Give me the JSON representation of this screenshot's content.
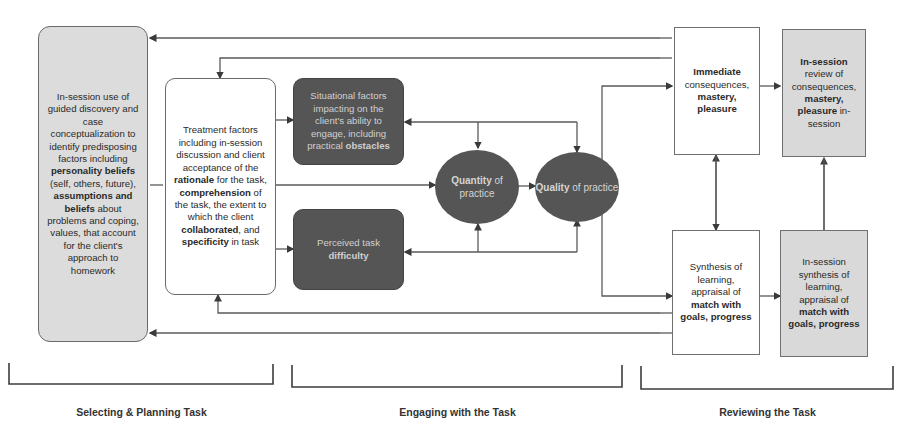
{
  "diagram": {
    "nodes": {
      "predisposing": {
        "parts": [
          {
            "t": "In-session use of guided discovery and case conceptualization to identify predisposing factors including ",
            "b": false
          },
          {
            "t": "personality beliefs",
            "b": true
          },
          {
            "t": " (self, others, future), ",
            "b": false
          },
          {
            "t": "assumptions and beliefs",
            "b": true
          },
          {
            "t": " about problems and coping, values, that account for the client's approach to homework",
            "b": false
          }
        ]
      },
      "treatment": {
        "parts": [
          {
            "t": "Treatment factors including in-session discussion and client acceptance of the ",
            "b": false
          },
          {
            "t": "rationale",
            "b": true
          },
          {
            "t": " for the task, ",
            "b": false
          },
          {
            "t": "comprehension",
            "b": true
          },
          {
            "t": " of the task, the extent to which the client ",
            "b": false
          },
          {
            "t": "collaborated",
            "b": true
          },
          {
            "t": ", and ",
            "b": false
          },
          {
            "t": "specificity",
            "b": true
          },
          {
            "t": " in task",
            "b": false
          }
        ]
      },
      "situational": {
        "parts": [
          {
            "t": "Situational factors impacting on the client's ability to engage, including practical ",
            "b": false
          },
          {
            "t": "obstacles",
            "b": true
          }
        ]
      },
      "difficulty": {
        "parts": [
          {
            "t": "Perceived task ",
            "b": false
          },
          {
            "t": "difficulty",
            "b": true
          }
        ]
      },
      "quantity": {
        "parts": [
          {
            "t": "Quantity",
            "b": true
          },
          {
            "t": " of practice",
            "b": false
          }
        ]
      },
      "quality": {
        "parts": [
          {
            "t": "Quality",
            "b": true
          },
          {
            "t": " of practice",
            "b": false
          }
        ]
      },
      "immediate": {
        "parts": [
          {
            "t": "Immediate",
            "b": true
          },
          {
            "t": " consequences, ",
            "b": false
          },
          {
            "t": "mastery, pleasure",
            "b": true
          }
        ]
      },
      "review": {
        "parts": [
          {
            "t": "In-session",
            "b": true
          },
          {
            "t": " review of consequences, ",
            "b": false
          },
          {
            "t": "mastery, pleasure",
            "b": true
          },
          {
            "t": " in-session",
            "b": false
          }
        ]
      },
      "synthesis": {
        "parts": [
          {
            "t": "Synthesis of learning, appraisal of ",
            "b": false
          },
          {
            "t": "match with goals, progress",
            "b": true
          }
        ]
      },
      "insession_synthesis": {
        "parts": [
          {
            "t": "In-session synthesis of learning, appraisal of ",
            "b": false
          },
          {
            "t": "match with goals, progress",
            "b": true
          }
        ]
      }
    },
    "phases": {
      "selecting": "Selecting & Planning Task",
      "engaging": "Engaging with the Task",
      "reviewing": "Reviewing the Task"
    },
    "colors": {
      "line": "#555555",
      "dark_fill": "#555555",
      "light_fill": "#dcdcdc",
      "grey_box": "#d9d9d9"
    }
  }
}
